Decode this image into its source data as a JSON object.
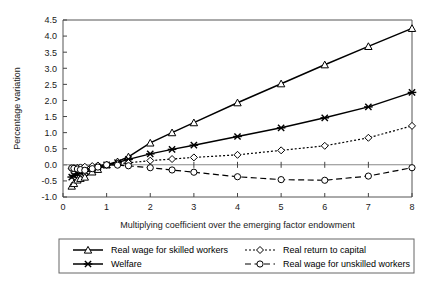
{
  "chart_data": {
    "type": "line",
    "title": "",
    "xlabel": "Multiplying coefficient over the emerging factor endowment",
    "ylabel": "Percentage variation",
    "xlim": [
      0,
      8
    ],
    "ylim": [
      -1.0,
      4.5
    ],
    "xticks": [
      0,
      1,
      2,
      3,
      4,
      5,
      6,
      7,
      8
    ],
    "xtick_labels": [
      "0",
      "1",
      "2",
      "3",
      "4",
      "5",
      "6",
      "7",
      "8"
    ],
    "yticks": [
      -1.0,
      -0.5,
      0.0,
      0.5,
      1.0,
      1.5,
      2.0,
      2.5,
      3.0,
      3.5,
      4.0,
      4.5
    ],
    "ytick_labels": [
      "-1.0",
      "-0.5",
      "0.0",
      "0.5",
      "1.0",
      "1.5",
      "2.0",
      "2.5",
      "3.0",
      "3.5",
      "4.0",
      "4.5"
    ],
    "grid": false,
    "legend_position": "below",
    "x": [
      0.2,
      0.25,
      0.33,
      0.4,
      0.5,
      0.67,
      0.8,
      1.0,
      1.25,
      1.5,
      2.0,
      2.5,
      3.0,
      4.0,
      5.0,
      6.0,
      7.0,
      8.0
    ],
    "series": [
      {
        "name": "Real wage for skilled workers",
        "marker": "triangle",
        "line_style": "solid",
        "color": "#000000",
        "values": [
          -0.66,
          -0.58,
          -0.47,
          -0.42,
          -0.38,
          -0.22,
          -0.14,
          0.0,
          0.1,
          0.25,
          0.68,
          1.0,
          1.31,
          1.93,
          2.52,
          3.11,
          3.68,
          4.24
        ]
      },
      {
        "name": "Welfare",
        "marker": "x",
        "line_style": "solid",
        "color": "#000000",
        "values": [
          -0.38,
          -0.33,
          -0.28,
          -0.24,
          -0.2,
          -0.12,
          -0.07,
          0.0,
          0.07,
          0.17,
          0.34,
          0.48,
          0.61,
          0.88,
          1.15,
          1.46,
          1.8,
          2.25
        ]
      },
      {
        "name": "Real return to capital",
        "marker": "diamond",
        "line_style": "dotted",
        "color": "#000000",
        "values": [
          -0.12,
          -0.1,
          -0.09,
          -0.08,
          -0.06,
          -0.04,
          -0.02,
          0.0,
          0.03,
          0.06,
          0.13,
          0.18,
          0.23,
          0.31,
          0.45,
          0.59,
          0.84,
          1.21
        ]
      },
      {
        "name": "Real wage for unskilled workers",
        "marker": "circle",
        "line_style": "dashed",
        "color": "#000000",
        "values": [
          -0.1,
          -0.11,
          -0.13,
          -0.15,
          -0.17,
          -0.12,
          -0.07,
          0.0,
          -0.01,
          -0.03,
          -0.09,
          -0.16,
          -0.23,
          -0.37,
          -0.46,
          -0.48,
          -0.35,
          -0.09
        ]
      }
    ]
  },
  "legend": {
    "entries": [
      {
        "label": "Real wage for skilled workers",
        "marker": "triangle",
        "line_style": "solid"
      },
      {
        "label": "Real return to capital",
        "marker": "diamond",
        "line_style": "dotted"
      },
      {
        "label": "Welfare",
        "marker": "x",
        "line_style": "solid"
      },
      {
        "label": "Real wage for unskilled workers",
        "marker": "circle",
        "line_style": "dashed"
      }
    ]
  }
}
